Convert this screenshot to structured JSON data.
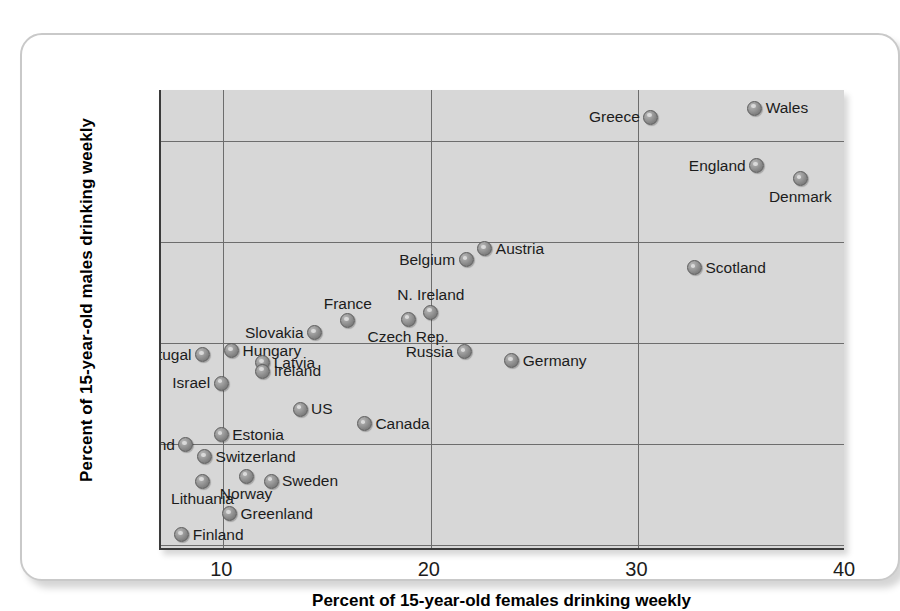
{
  "chart_data": {
    "type": "scatter",
    "title": "",
    "xlabel": "Percent of 15-year-old females drinking weekly",
    "ylabel": "Percent of 15-year-old males drinking weekly",
    "xlim": [
      7.0,
      40.0
    ],
    "ylim": [
      9.5,
      55.0
    ],
    "xticks": [
      10,
      20,
      30,
      40
    ],
    "yticks": [
      10,
      20,
      30,
      40,
      50
    ],
    "xtick_labels": [
      "10",
      "20",
      "30",
      "40"
    ],
    "ytick_labels": [
      "10",
      "20",
      "30",
      "40",
      "50"
    ],
    "grid": "both",
    "legend": "none",
    "marker_style": "gray-sphere",
    "points": [
      {
        "label": "Wales",
        "x": 35.6,
        "y": 53.2,
        "label_pos": "right"
      },
      {
        "label": "Greece",
        "x": 30.6,
        "y": 52.3,
        "label_pos": "left"
      },
      {
        "label": "England",
        "x": 35.7,
        "y": 47.5,
        "label_pos": "left"
      },
      {
        "label": "Denmark",
        "x": 37.8,
        "y": 46.2,
        "label_pos": "below"
      },
      {
        "label": "Austria",
        "x": 22.6,
        "y": 39.3,
        "label_pos": "right"
      },
      {
        "label": "Belgium",
        "x": 21.7,
        "y": 38.2,
        "label_pos": "left"
      },
      {
        "label": "Scotland",
        "x": 32.7,
        "y": 37.4,
        "label_pos": "right"
      },
      {
        "label": "N. Ireland",
        "x": 20.0,
        "y": 33.0,
        "label_pos": "above"
      },
      {
        "label": "Czech Rep.",
        "x": 18.9,
        "y": 32.3,
        "label_pos": "below"
      },
      {
        "label": "France",
        "x": 16.0,
        "y": 32.2,
        "label_pos": "above"
      },
      {
        "label": "Slovakia",
        "x": 14.4,
        "y": 31.0,
        "label_pos": "left"
      },
      {
        "label": "Russia",
        "x": 21.6,
        "y": 29.1,
        "label_pos": "left"
      },
      {
        "label": "Hungary",
        "x": 10.4,
        "y": 29.2,
        "label_pos": "right"
      },
      {
        "label": "Portugal",
        "x": 9.0,
        "y": 28.8,
        "label_pos": "left"
      },
      {
        "label": "Germany",
        "x": 23.9,
        "y": 28.2,
        "label_pos": "right"
      },
      {
        "label": "Latvia",
        "x": 11.9,
        "y": 28.0,
        "label_pos": "right"
      },
      {
        "label": "Ireland",
        "x": 11.9,
        "y": 27.2,
        "label_pos": "right"
      },
      {
        "label": "Israel",
        "x": 9.9,
        "y": 26.0,
        "label_pos": "left"
      },
      {
        "label": "US",
        "x": 13.7,
        "y": 23.4,
        "label_pos": "right"
      },
      {
        "label": "Canada",
        "x": 16.8,
        "y": 22.0,
        "label_pos": "right"
      },
      {
        "label": "Estonia",
        "x": 9.9,
        "y": 20.9,
        "label_pos": "right"
      },
      {
        "label": "Poland",
        "x": 8.2,
        "y": 19.9,
        "label_pos": "left"
      },
      {
        "label": "Switzerland",
        "x": 9.1,
        "y": 18.7,
        "label_pos": "right"
      },
      {
        "label": "Norway",
        "x": 11.1,
        "y": 16.8,
        "label_pos": "below"
      },
      {
        "label": "Sweden",
        "x": 12.3,
        "y": 16.3,
        "label_pos": "right"
      },
      {
        "label": "Lithuania",
        "x": 9.0,
        "y": 16.3,
        "label_pos": "below"
      },
      {
        "label": "Greenland",
        "x": 10.3,
        "y": 13.1,
        "label_pos": "right"
      },
      {
        "label": "Finland",
        "x": 8.0,
        "y": 11.0,
        "label_pos": "right"
      }
    ]
  },
  "colors": {
    "panel_background": "#d7d7d7",
    "gridline": "#6d6d6d",
    "axis_line": "#3a3a3a",
    "marker_fill": "#8f8f8f",
    "text": "#1c1c1c",
    "card_border": "#c9c9c9",
    "page_background": "#ffffff"
  }
}
